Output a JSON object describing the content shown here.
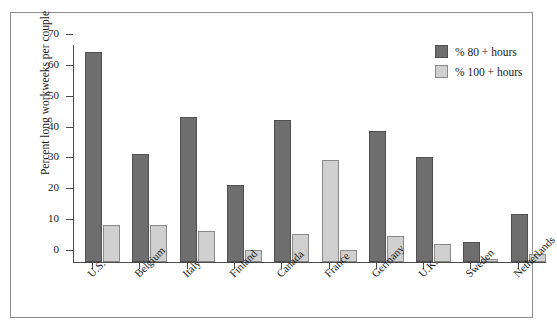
{
  "chart_data": {
    "type": "bar",
    "title": "",
    "xlabel": "",
    "ylabel": "Percent long workweeks per couple",
    "ylim": [
      0,
      70
    ],
    "yticks": [
      0,
      10,
      20,
      30,
      40,
      50,
      60,
      70
    ],
    "ytick_labels": [
      "0",
      "10",
      "20",
      "30",
      "40",
      "50",
      "60",
      "70"
    ],
    "grid": false,
    "legend_position": "top-right",
    "categories": [
      "U.S.",
      "Belgium",
      "Italy",
      "Finland",
      "Canada",
      "France",
      "Germany",
      "U.K.",
      "Sweden",
      "Netherlands"
    ],
    "series": [
      {
        "name": "% 80 + hours",
        "color": "#6e6e6e",
        "values": [
          68,
          35,
          47,
          25,
          46,
          33,
          42.5,
          34,
          6.5,
          15.5
        ],
        "value_colors": [
          "#6e6e6e",
          "#6e6e6e",
          "#6e6e6e",
          "#6e6e6e",
          "#6e6e6e",
          "#cfcfcf",
          "#6e6e6e",
          "#6e6e6e",
          "#6e6e6e",
          "#6e6e6e"
        ]
      },
      {
        "name": "% 100 + hours",
        "color": "#cfcfcf",
        "values": [
          12,
          12,
          10,
          4,
          9,
          4,
          8.5,
          6,
          1,
          2.5
        ],
        "value_colors": [
          "#cfcfcf",
          "#cfcfcf",
          "#cfcfcf",
          "#cfcfcf",
          "#cfcfcf",
          "#cfcfcf",
          "#cfcfcf",
          "#cfcfcf",
          "#cfcfcf",
          "#cfcfcf"
        ]
      }
    ]
  },
  "legend": {
    "items": [
      {
        "label": "% 80 + hours",
        "swatch": "dark"
      },
      {
        "label": "% 100 + hours",
        "swatch": "light"
      }
    ]
  },
  "axes": {
    "y_title": "Percent long workweeks per couple"
  }
}
